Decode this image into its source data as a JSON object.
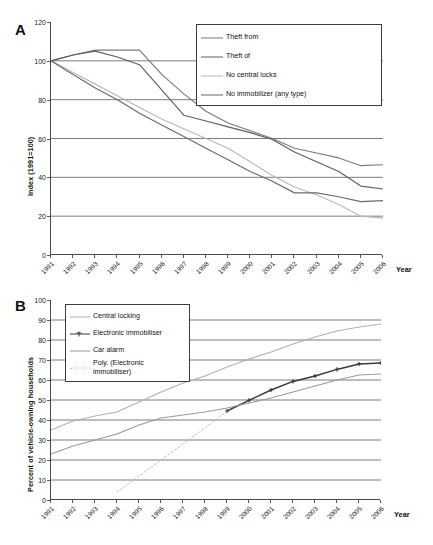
{
  "figure": {
    "panels": [
      "A",
      "B"
    ],
    "background": "#ffffff"
  },
  "panelA": {
    "letter": "A",
    "ylabel": "Index (1991=100)",
    "xlabel": "Year",
    "yticks": [
      "0",
      "20",
      "40",
      "60",
      "80",
      "100",
      "120"
    ],
    "xticks": [
      "1991",
      "1992",
      "1993",
      "1994",
      "1995",
      "1996",
      "1997",
      "1998",
      "1999",
      "2000",
      "2001",
      "2002",
      "2003",
      "2004",
      "2005",
      "2006"
    ],
    "legend": [
      {
        "label": "Theft from",
        "color": "#7a7a7a",
        "style": "solid"
      },
      {
        "label": "Theft of",
        "color": "#5e5e5e",
        "style": "solid"
      },
      {
        "label": "No central locks",
        "color": "#b9b9b9",
        "style": "solid"
      },
      {
        "label": "No immobilizer (any type)",
        "color": "#6b6b6b",
        "style": "solid"
      }
    ]
  },
  "panelB": {
    "letter": "B",
    "ylabel": "Percent of vehicle-owning households",
    "xlabel": "Year",
    "yticks": [
      "0",
      "10",
      "20",
      "30",
      "40",
      "50",
      "60",
      "70",
      "80",
      "90",
      "100"
    ],
    "xticks": [
      "1991",
      "1992",
      "1993",
      "1994",
      "1995",
      "1996",
      "1997",
      "1998",
      "1999",
      "2000",
      "2001",
      "2002",
      "2003",
      "2004",
      "2005",
      "2006"
    ],
    "legend": [
      {
        "label": "Central locking",
        "color": "#b0b0b0",
        "style": "solid",
        "marker": "none"
      },
      {
        "label": "Electronic immobiliser",
        "color": "#3a3a3a",
        "style": "solid",
        "marker": "cross"
      },
      {
        "label": "Car alarm",
        "color": "#9a9a9a",
        "style": "solid",
        "marker": "none"
      },
      {
        "label": "Poly. (Electronic\nimmobiliser)",
        "color": "#c2c2c2",
        "style": "dotted",
        "marker": "none"
      }
    ]
  },
  "chart_data": [
    {
      "type": "line",
      "panel": "A",
      "title": "",
      "xlabel": "Year",
      "ylabel": "Index (1991=100)",
      "ylim": [
        0,
        120
      ],
      "ytick_step": 20,
      "grid": "horizontal",
      "legend_position": "top-right",
      "x": [
        1991,
        1992,
        1993,
        1994,
        1995,
        1996,
        1997,
        1998,
        1999,
        2000,
        2001,
        2002,
        2003,
        2004,
        2005,
        2006
      ],
      "series": [
        {
          "name": "Theft from",
          "color": "#7a7a7a",
          "values": [
            100,
            103,
            105.5,
            105.5,
            105.5,
            93,
            83,
            74,
            68,
            64,
            60,
            55,
            52.5,
            50,
            46,
            46.5
          ]
        },
        {
          "name": "Theft of",
          "color": "#5e5e5e",
          "values": [
            100,
            103,
            105,
            102,
            98,
            85,
            72,
            69,
            66,
            63,
            59.5,
            53,
            48,
            43,
            35.5,
            34
          ]
        },
        {
          "name": "No central locks",
          "color": "#b9b9b9",
          "values": [
            100,
            94,
            88,
            82,
            76,
            70,
            65,
            60,
            55,
            48,
            41,
            35,
            31,
            26,
            20,
            19
          ]
        },
        {
          "name": "No immobilizer (any type)",
          "color": "#6b6b6b",
          "values": [
            100,
            93,
            86,
            80,
            73,
            67,
            61,
            55,
            49,
            43,
            38,
            32,
            32,
            30,
            27.5,
            28
          ]
        }
      ]
    },
    {
      "type": "line",
      "panel": "B",
      "title": "",
      "xlabel": "Year",
      "ylabel": "Percent of vehicle-owning households",
      "ylim": [
        0,
        100
      ],
      "ytick_step": 10,
      "grid": "horizontal",
      "legend_position": "top-left",
      "x": [
        1991,
        1992,
        1993,
        1994,
        1995,
        1996,
        1997,
        1998,
        1999,
        2000,
        2001,
        2002,
        2003,
        2004,
        2005,
        2006
      ],
      "series": [
        {
          "name": "Central locking",
          "color": "#b0b0b0",
          "marker": "none",
          "values": [
            35,
            39.5,
            42,
            44,
            49,
            54,
            58.5,
            62,
            66.5,
            70.5,
            74,
            78,
            81.5,
            84.5,
            86.5,
            88
          ]
        },
        {
          "name": "Electronic immobiliser",
          "color": "#3a3a3a",
          "marker": "cross",
          "values": [
            null,
            null,
            null,
            null,
            null,
            null,
            null,
            null,
            44.5,
            49.8,
            55,
            59.3,
            62,
            65.3,
            68,
            68.5
          ]
        },
        {
          "name": "Car alarm",
          "color": "#9a9a9a",
          "marker": "none",
          "values": [
            23,
            27,
            30,
            33,
            37.5,
            41,
            42.5,
            44,
            46,
            48.5,
            51,
            54,
            57,
            60,
            62.5,
            63
          ]
        },
        {
          "name": "Poly. (Electronic immobiliser)",
          "color": "#c2c2c2",
          "marker": "none",
          "style": "dotted",
          "values": [
            null,
            null,
            null,
            4,
            12,
            20,
            28,
            36,
            44.5,
            null,
            null,
            null,
            null,
            null,
            null,
            null
          ]
        }
      ]
    }
  ]
}
